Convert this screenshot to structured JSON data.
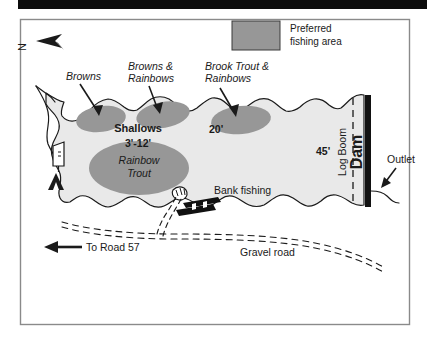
{
  "map": {
    "title": "Lake fishing access map",
    "colors": {
      "water": "#e9e9e9",
      "preferred_area": "#979797",
      "shoreline": "#1a1a1a",
      "dam": "#111111",
      "border": "#8a8a8a",
      "scan_bar": "#0c0c0c"
    },
    "legend": {
      "swatch_name": "preferred-fishing-area-swatch",
      "line1": "Preferred",
      "line2": "fishing area"
    },
    "compass": {
      "label": "N",
      "direction": "west"
    },
    "fish_area_labels": [
      {
        "id": "browns",
        "text": "Browns"
      },
      {
        "id": "browns-rainbows-1",
        "text": "Browns &"
      },
      {
        "id": "browns-rainbows-2",
        "text": "Rainbows"
      },
      {
        "id": "brook-rainbows-1",
        "text": "Brook Trout &"
      },
      {
        "id": "brook-rainbows-2",
        "text": "Rainbows"
      },
      {
        "id": "rainbow-trout-1",
        "text": "Rainbow"
      },
      {
        "id": "rainbow-trout-2",
        "text": "Trout"
      }
    ],
    "shallows": {
      "label": "Shallows",
      "depth": "3'-12'"
    },
    "depths": [
      {
        "id": "depth-20",
        "text": "20'"
      },
      {
        "id": "depth-45",
        "text": "45'"
      }
    ],
    "features": {
      "bank_fishing": "Bank fishing",
      "log_boom": "Log Boom",
      "dam": "Dam",
      "outlet": "Outlet",
      "gravel_road": "Gravel road",
      "to_road": "To Road 57"
    },
    "icons": {
      "sign": "information-sign-icon",
      "camp": "tent-camping-icon",
      "boat_ramp": "boat-ramp-icon",
      "parking": "parking-lot-icon"
    }
  }
}
